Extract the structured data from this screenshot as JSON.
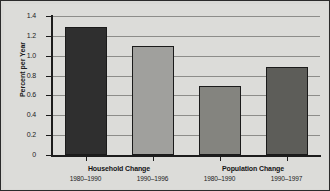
{
  "chart_data": {
    "type": "bar",
    "title": "",
    "xlabel": "",
    "ylabel": "Percent per Year",
    "ylim": [
      0,
      1.4
    ],
    "ytick_step": 0.2,
    "yticks": [
      "0",
      "0.2",
      "0.4",
      "0.6",
      "0.8",
      "1.0",
      "1.2",
      "1.4"
    ],
    "grid": true,
    "legend": "none",
    "groups": [
      {
        "name": "Household Change",
        "categories": [
          "1980–1990",
          "1990–1996"
        ]
      },
      {
        "name": "Population Change",
        "categories": [
          "1980–1990",
          "1990–1997"
        ]
      }
    ],
    "categories": [
      "1980–1990",
      "1990–1996",
      "1980–1990",
      "1990–1997"
    ],
    "values": [
      1.29,
      1.1,
      0.7,
      0.89
    ],
    "bar_colors": [
      "#2f2f2f",
      "#a0a09d",
      "#84847f",
      "#5d5d59"
    ]
  },
  "figure": {
    "background": "#dcdcd9",
    "border_color": "#2b2b2b",
    "gridline_color": "#8d8d8a",
    "axis_color": "#1c1c1c"
  }
}
